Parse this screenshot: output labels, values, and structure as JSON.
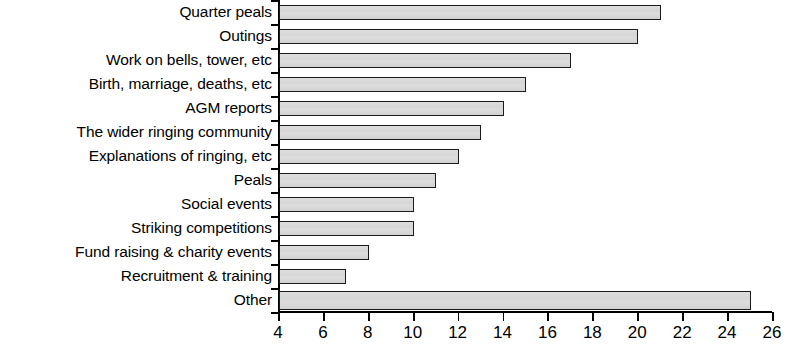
{
  "chart_data": {
    "type": "bar",
    "orientation": "horizontal",
    "title": "",
    "xlabel": "",
    "ylabel": "",
    "xlim": [
      4,
      26
    ],
    "xticks": [
      4,
      6,
      8,
      10,
      12,
      14,
      16,
      18,
      20,
      22,
      24,
      26
    ],
    "xtick_labels": [
      "4",
      "6",
      "8",
      "10",
      "12",
      "14",
      "16",
      "18",
      "20",
      "22",
      "24",
      "26"
    ],
    "grid": false,
    "legend": null,
    "bar_fill_color": "#d9d9d9",
    "bar_edge_color": "#1a1a1a",
    "categories": [
      "Quarter peals",
      "Outings",
      "Work on bells, tower, etc",
      "Birth, marriage, deaths, etc",
      "AGM reports",
      "The wider ringing community",
      "Explanations of ringing, etc",
      "Peals",
      "Social events",
      "Striking competitions",
      "Fund raising & charity events",
      "Recruitment & training",
      "Other"
    ],
    "values": [
      21,
      20,
      17,
      15,
      14,
      13,
      12,
      11,
      10,
      10,
      8,
      7,
      25
    ]
  }
}
